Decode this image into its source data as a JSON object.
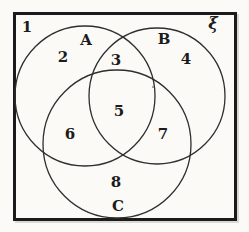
{
  "figure": {
    "type": "venn-diagram",
    "universal_set_symbol": "ξ",
    "sets": {
      "a": "A",
      "b": "B",
      "c": "C"
    },
    "regions": {
      "r1": "1",
      "r2": "2",
      "r3": "3",
      "r4": "4",
      "r5": "5",
      "r6": "6",
      "r7": "7",
      "r8": "8"
    },
    "colors": {
      "paper": "#fbfaf7",
      "ink": "#1c1c1c",
      "frame_border": "#1b1b1b",
      "circle_stroke": "#2e2e2e"
    }
  }
}
